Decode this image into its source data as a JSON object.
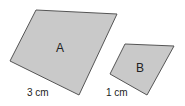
{
  "diagram": {
    "shapes": [
      {
        "id": "A",
        "label": "A",
        "points": "36,10 117,14 79,95 10,61",
        "label_pos": [
          60,
          50
        ],
        "side_label": "3 cm",
        "side_label_pos": [
          27,
          95
        ]
      },
      {
        "id": "B",
        "label": "B",
        "points": "125,44 174,46 147,95 110,74",
        "label_pos": [
          140,
          72
        ],
        "side_label": "1 cm",
        "side_label_pos": [
          106,
          95
        ]
      }
    ],
    "fill": "#c9c9c9",
    "stroke": "#555555"
  }
}
